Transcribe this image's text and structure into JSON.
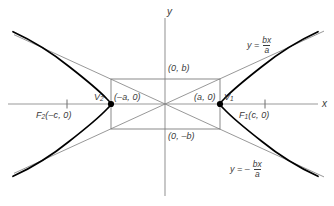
{
  "figure": {
    "colors": {
      "axis": "#9a9a9a",
      "curve": "#000000",
      "guide": "#7d7d7d",
      "text": "#3b3b3b",
      "background": "#ffffff"
    },
    "axes": {
      "x_label": "x",
      "y_label": "y",
      "origin": {
        "x": 165,
        "y": 104
      },
      "x_range_px": [
        8,
        322
      ],
      "y_range_px": [
        18,
        196
      ]
    },
    "curve": {
      "type": "hyperbola",
      "orientation": "horizontal",
      "equation_form": "x^2/a^2 - y^2/b^2 = 1",
      "a_px": 54,
      "b_px": 25,
      "c_px": 98
    },
    "asymptotes": [
      {
        "name": "upper-right-asymptote",
        "slope": "b/a",
        "label": {
          "lead": "y =",
          "numerator": "bx",
          "denominator": "a",
          "sign": ""
        }
      },
      {
        "name": "lower-right-asymptote",
        "slope": "-b/a",
        "label": {
          "lead": "y = –",
          "numerator": "bx",
          "denominator": "a",
          "sign": "-"
        }
      }
    ],
    "points": [
      {
        "name": "vertex-right",
        "marker": "V",
        "subscript": "1",
        "coord_label": "(a, 0)",
        "px": {
          "x": 220,
          "y": 104
        }
      },
      {
        "name": "vertex-left",
        "marker": "V",
        "subscript": "2",
        "coord_label": "(–a, 0)",
        "px": {
          "x": 111,
          "y": 104
        }
      },
      {
        "name": "focus-right",
        "marker": "F",
        "subscript": "1",
        "coord_label": "(c, 0)",
        "px": {
          "x": 265,
          "y": 104
        }
      },
      {
        "name": "focus-left",
        "marker": "F",
        "subscript": "2",
        "coord_label": "(–c, 0)",
        "px": {
          "x": 67,
          "y": 104
        }
      }
    ],
    "labels": {
      "b_positive": "(0, b)",
      "b_negative": "(0, –b)",
      "vertex_right_coord": "(a, 0)",
      "vertex_left_coord": "(–a, 0)",
      "vertex_right_name": "V",
      "vertex_right_sub": "1",
      "vertex_left_name": "V",
      "vertex_left_sub": "2",
      "focus_right_name": "F",
      "focus_right_sub": "1",
      "focus_right_coord": "(c, 0)",
      "focus_left_name": "F",
      "focus_left_sub": "2",
      "focus_left_coord": "(–c, 0)"
    },
    "rectangle": {
      "name": "central-rectangle",
      "left_px": 111,
      "right_px": 220,
      "top_px": 79,
      "bottom_px": 129
    }
  }
}
